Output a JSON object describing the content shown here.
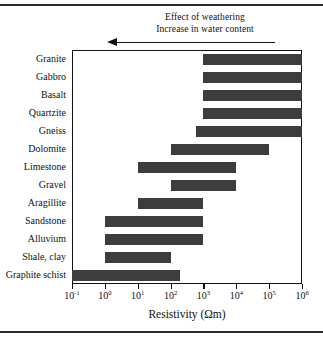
{
  "figure": {
    "annotation_line1": "Effect of weathering",
    "annotation_line2": "Increase in water content",
    "arrow_direction": "left",
    "axis_title": "Resistivity (Ωm)",
    "bar_color": "#3d3d3d",
    "frame_color": "#111111"
  },
  "chart_data": {
    "type": "bar",
    "orientation": "horizontal",
    "title": "",
    "subtitle": "",
    "xlabel": "Resistivity (Ωm)",
    "ylabel": "",
    "xscale": "log",
    "xlim": [
      0.1,
      1000000
    ],
    "xticks": [
      0.1,
      1,
      10,
      100,
      1000,
      10000,
      100000,
      1000000
    ],
    "xtick_labels": [
      "10⁻¹",
      "10⁰",
      "10¹",
      "10²",
      "10³",
      "10⁴",
      "10⁵",
      "10⁶"
    ],
    "xtick_mantissa": [
      "10",
      "10",
      "10",
      "10",
      "10",
      "10",
      "10",
      "10"
    ],
    "xtick_exponents": [
      "-1",
      "0",
      "1",
      "2",
      "3",
      "4",
      "5",
      "6"
    ],
    "grid": false,
    "legend": null,
    "annotations": [
      {
        "text": "Effect of weathering",
        "position": "above-axis"
      },
      {
        "text": "Increase in water content",
        "position": "above-axis"
      },
      {
        "text": "left-pointing arrow spanning from ~10⁵ to ~10¹",
        "position": "above-axis"
      }
    ],
    "categories": [
      "Granite",
      "Gabbro",
      "Basalt",
      "Quartzite",
      "Gneiss",
      "Dolomite",
      "Limestone",
      "Gravel",
      "Aragillite",
      "Sandstone",
      "Alluvium",
      "Shale, clay",
      "Graphite schist"
    ],
    "ranges": [
      {
        "category": "Granite",
        "min": 1000,
        "max": 1000000
      },
      {
        "category": "Gabbro",
        "min": 1000,
        "max": 1000000
      },
      {
        "category": "Basalt",
        "min": 1000,
        "max": 1000000
      },
      {
        "category": "Quartzite",
        "min": 1000,
        "max": 1000000
      },
      {
        "category": "Gneiss",
        "min": 600,
        "max": 1000000
      },
      {
        "category": "Dolomite",
        "min": 100,
        "max": 100000
      },
      {
        "category": "Limestone",
        "min": 10,
        "max": 10000
      },
      {
        "category": "Gravel",
        "min": 100,
        "max": 10000
      },
      {
        "category": "Aragillite",
        "min": 10,
        "max": 1000
      },
      {
        "category": "Sandstone",
        "min": 1,
        "max": 1000
      },
      {
        "category": "Alluvium",
        "min": 1,
        "max": 1000
      },
      {
        "category": "Shale, clay",
        "min": 1,
        "max": 100
      },
      {
        "category": "Graphite schist",
        "min": 0.1,
        "max": 200
      }
    ]
  }
}
